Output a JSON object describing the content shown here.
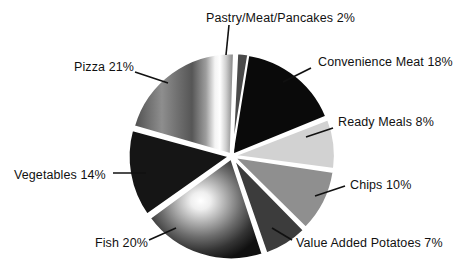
{
  "chart_data": {
    "type": "pie",
    "title": "",
    "subtitle": "",
    "xlabel": "",
    "ylabel": "",
    "grid": false,
    "legend_position": "none",
    "label_format": "{name} {value}%",
    "units": "percent",
    "total": 100,
    "categories": [
      "Convenience Meat",
      "Ready Meals",
      "Chips",
      "Value Added Potatoes",
      "Fish",
      "Vegetables",
      "Pizza",
      "Pastry/Meat/Pancakes"
    ],
    "values": [
      18,
      8,
      10,
      7,
      20,
      14,
      21,
      2
    ],
    "slices": [
      {
        "name": "Convenience Meat",
        "value": 18,
        "label": "Convenience Meat 18%",
        "fill": "#0a0a0a",
        "style": "solid",
        "start_deg": 3,
        "end_deg": 67.8,
        "explode": 1.5,
        "label_x": 318,
        "label_y": 56,
        "label_align": "left",
        "leader": [
          311,
          68,
          283,
          82
        ]
      },
      {
        "name": "Ready Meals",
        "value": 8,
        "label": "Ready Meals 8%",
        "fill": "#d2d2d2",
        "style": "solid",
        "start_deg": 68.8,
        "end_deg": 97.6,
        "explode": 2,
        "label_x": 338,
        "label_y": 116,
        "label_align": "left",
        "leader": [
          333,
          128,
          306,
          137
        ]
      },
      {
        "name": "Chips",
        "value": 10,
        "label": "Chips 10%",
        "fill": "#8f8f8f",
        "style": "solid",
        "start_deg": 98.6,
        "end_deg": 134.6,
        "explode": 2,
        "label_x": 350,
        "label_y": 179,
        "label_align": "left",
        "leader": [
          345,
          186,
          315,
          196
        ]
      },
      {
        "name": "Value Added Potatoes",
        "value": 7,
        "label": "Value Added Potatoes 7%",
        "fill": "#3c3c3c",
        "style": "solid",
        "start_deg": 135.6,
        "end_deg": 160.8,
        "explode": 2.5,
        "label_x": 296,
        "label_y": 237,
        "label_align": "left",
        "leader": [
          292,
          240,
          272,
          228
        ]
      },
      {
        "name": "Fish",
        "value": 20,
        "label": "Fish 20%",
        "fill": "#5c5c5c",
        "style": "radial-sphere",
        "start_deg": 161.8,
        "end_deg": 233.8,
        "explode": 2.5,
        "label_x": 95,
        "label_y": 237,
        "label_align": "left",
        "leader": [
          149,
          240,
          176,
          228
        ]
      },
      {
        "name": "Vegetables",
        "value": 14,
        "label": "Vegetables 14%",
        "fill": "#151515",
        "style": "solid",
        "start_deg": 234.8,
        "end_deg": 285.2,
        "explode": 2.5,
        "label_x": 14,
        "label_y": 169,
        "label_align": "left",
        "leader": [
          113,
          173,
          146,
          173
        ]
      },
      {
        "name": "Pizza",
        "value": 21,
        "label": "Pizza 21%",
        "fill": "#7a7a7a",
        "style": "metallic-vertical",
        "start_deg": 286.2,
        "end_deg": 361.8,
        "explode": 2,
        "label_x": 74,
        "label_y": 61,
        "label_align": "left",
        "leader": [
          135,
          72,
          168,
          83
        ]
      },
      {
        "name": "Pastry/Meat/Pancakes",
        "value": 2,
        "label": "Pastry/Meat/Pancakes 2%",
        "fill": "#4a4a4a",
        "style": "solid",
        "start_deg": 362.8,
        "end_deg": 369.2,
        "explode": 2,
        "label_x": 206,
        "label_y": 12,
        "label_align": "left",
        "leader": [
          229,
          25,
          226,
          55
        ]
      }
    ],
    "geometry": {
      "center_x": 232,
      "center_y": 156,
      "radius": 101
    },
    "colors": {
      "background": "#ffffff",
      "text": "#111111",
      "leader_line": "#111111",
      "slice_gap": "#ffffff"
    }
  }
}
